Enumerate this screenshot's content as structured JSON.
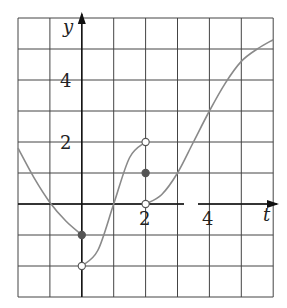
{
  "chart_data": {
    "type": "line",
    "title": "",
    "xlabel": "t",
    "ylabel": "y",
    "xlim": [
      -2,
      6
    ],
    "ylim": [
      -3,
      6
    ],
    "grid": true,
    "x_ticks_labeled": [
      2,
      4
    ],
    "y_ticks_labeled": [
      2,
      4
    ],
    "x_tick_labels": [
      "2",
      "4"
    ],
    "y_tick_labels": [
      "2",
      "4"
    ],
    "series": [
      {
        "name": "segment-left",
        "points": [
          [
            -2,
            1.8
          ],
          [
            -1.5,
            0.85
          ],
          [
            -1,
            0.05
          ],
          [
            -0.5,
            -0.55
          ],
          [
            0,
            -1
          ]
        ]
      },
      {
        "name": "segment-middle",
        "points": [
          [
            0,
            -2
          ],
          [
            0.5,
            -1.5
          ],
          [
            1,
            0
          ],
          [
            1.5,
            1.5
          ],
          [
            2,
            2
          ]
        ]
      },
      {
        "name": "segment-right",
        "points": [
          [
            2,
            0
          ],
          [
            2.5,
            0.3
          ],
          [
            3,
            1
          ],
          [
            3.5,
            2
          ],
          [
            4,
            3
          ],
          [
            4.5,
            3.9
          ],
          [
            5,
            4.6
          ],
          [
            5.5,
            5.0
          ],
          [
            6,
            5.3
          ]
        ]
      }
    ],
    "markers": [
      {
        "x": 0,
        "y": -1,
        "type": "filled"
      },
      {
        "x": 0,
        "y": -2,
        "type": "open"
      },
      {
        "x": 2,
        "y": 2,
        "type": "open"
      },
      {
        "x": 2,
        "y": 1,
        "type": "filled"
      },
      {
        "x": 2,
        "y": 0,
        "type": "open"
      }
    ]
  },
  "labels": {
    "x_axis": "t",
    "y_axis": "y",
    "tick_x_2": "2",
    "tick_x_4": "4",
    "tick_y_2": "2",
    "tick_y_4": "4"
  },
  "colors": {
    "grid": "#444444",
    "curve": "#8a8a8a",
    "axis": "#111111",
    "dot": "#555555"
  }
}
